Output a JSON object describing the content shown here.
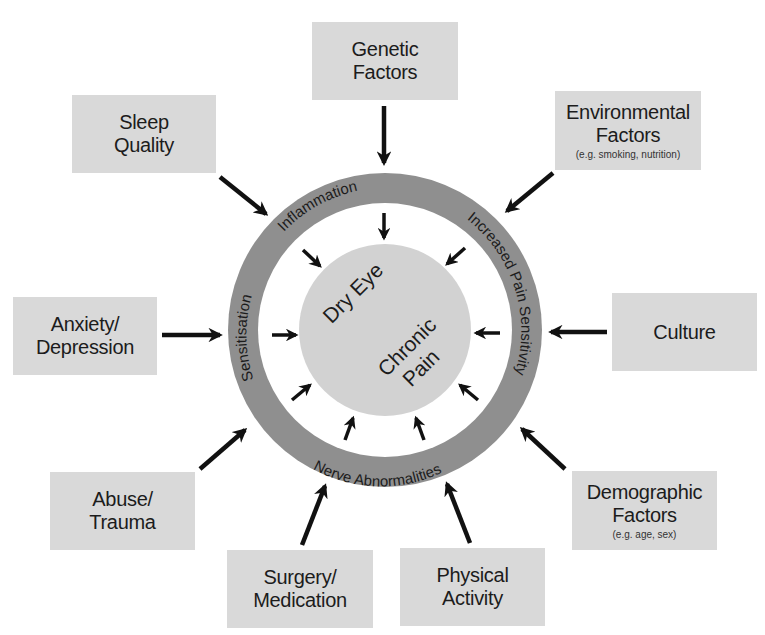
{
  "diagram": {
    "colors": {
      "background": "#ffffff",
      "box_fill": "#d9d9d9",
      "ring_fill": "#8f8f8f",
      "ring_inner_gap": "#ffffff",
      "core_fill": "#d2d2d2",
      "arrow": "#111111",
      "text": "#1c1c1c"
    },
    "core": {
      "line1": "Dry Eye",
      "line2a": "Chronic",
      "line2b": "Pain"
    },
    "ring_labels": {
      "top": "Inflammation",
      "right": "Increased Pain Sensitivity",
      "bottom": "Nerve Abnormalities",
      "left": "Sensitisation"
    },
    "factors": [
      {
        "id": "genetic",
        "line1": "Genetic",
        "line2": "Factors",
        "note": ""
      },
      {
        "id": "sleep",
        "line1": "Sleep",
        "line2": "Quality",
        "note": ""
      },
      {
        "id": "environmental",
        "line1": "Environmental",
        "line2": "Factors",
        "note": "(e.g. smoking, nutrition)"
      },
      {
        "id": "anxiety",
        "line1": "Anxiety/",
        "line2": "Depression",
        "note": ""
      },
      {
        "id": "culture",
        "line1": "Culture",
        "line2": "",
        "note": ""
      },
      {
        "id": "abuse",
        "line1": "Abuse/",
        "line2": "Trauma",
        "note": ""
      },
      {
        "id": "demographic",
        "line1": "Demographic",
        "line2": "Factors",
        "note": "(e.g. age, sex)"
      },
      {
        "id": "surgery",
        "line1": "Surgery/",
        "line2": "Medication",
        "note": ""
      },
      {
        "id": "physical",
        "line1": "Physical",
        "line2": "Activity",
        "note": ""
      }
    ]
  }
}
